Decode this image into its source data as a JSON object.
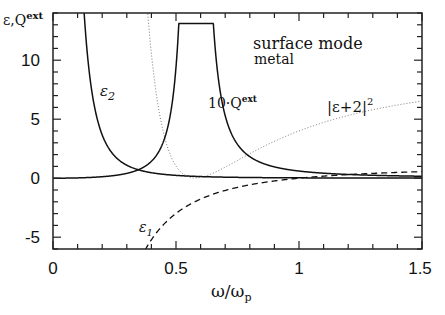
{
  "chart_data": {
    "type": "line",
    "title": "surface mode",
    "subtitle": "metal",
    "xlabel": "ω/ω_p",
    "ylabel": "ε,Q^ext",
    "xlim": [
      0,
      1.5
    ],
    "ylim": [
      -6,
      14
    ],
    "xticks": [
      "0",
      "0.5",
      "1",
      "1.5"
    ],
    "yticks": [
      "-5",
      "0",
      "5",
      "10"
    ],
    "grid": false,
    "series": [
      {
        "name": "ε1",
        "style": "dashed",
        "description": "Drude real part 1 - 1/ω²",
        "x": [
          0.38,
          0.45,
          0.5,
          0.6,
          0.7,
          0.8,
          0.9,
          1.0,
          1.2,
          1.5
        ],
        "values": [
          -5.9,
          -3.94,
          -3.0,
          -1.78,
          -1.04,
          -0.56,
          -0.23,
          0.0,
          0.31,
          0.56
        ]
      },
      {
        "name": "ε2",
        "style": "solid",
        "description": "Drude imaginary part",
        "x": [
          0.17,
          0.2,
          0.25,
          0.3,
          0.4,
          0.5,
          0.7,
          1.0,
          1.5
        ],
        "values": [
          14,
          12.5,
          6.4,
          3.7,
          1.56,
          0.8,
          0.29,
          0.1,
          0.03
        ]
      },
      {
        "name": "10·Q^ext",
        "style": "solid",
        "peak_x": 0.585,
        "peak_y": 13.0,
        "x": [
          0,
          0.3,
          0.45,
          0.5,
          0.55,
          0.585,
          0.62,
          0.7,
          0.8,
          1.0,
          1.5
        ],
        "values": [
          0,
          0.05,
          0.4,
          0.9,
          3.5,
          13.0,
          3.5,
          0.8,
          0.3,
          0.1,
          0.03
        ]
      },
      {
        "name": "|ε+2|²",
        "style": "dotted",
        "x": [
          0.37,
          0.45,
          0.5,
          0.577,
          0.65,
          0.8,
          1.0,
          1.2,
          1.5
        ],
        "values": [
          14,
          3.8,
          1.0,
          0.0,
          0.5,
          2.1,
          4.0,
          5.3,
          6.5
        ]
      }
    ],
    "annotations": [
      "surface mode",
      "metal",
      "ε2",
      "10·Q^ext",
      "|ε+2|²",
      "ε1"
    ]
  }
}
